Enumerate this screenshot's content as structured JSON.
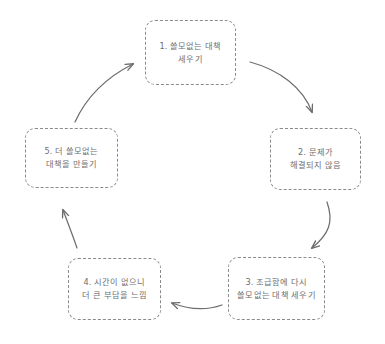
{
  "diagram": {
    "type": "cycle",
    "title": "",
    "background_color": "#ffffff",
    "node_border_color": "#8a8a8a",
    "node_text_color": "#6e6e6e",
    "arrow_color": "#6e6e6e",
    "nodes": [
      {
        "id": "1",
        "number": "1.",
        "label": "1. 쓸모없는 대책\n세우기",
        "line1": "1. 쓸모없는 대책",
        "line2": "세우기"
      },
      {
        "id": "2",
        "number": "2.",
        "label": "2. 문제가\n해결되지 않음",
        "line1": "2. 문제가",
        "line2": "해결되지 않음"
      },
      {
        "id": "3",
        "number": "3.",
        "label": "3. 조급함에 다시\n쓸모없는 대책 세우기",
        "line1": "3. 조급함에 다시",
        "line2": "쓸모없는 대책 세우기"
      },
      {
        "id": "4",
        "number": "4.",
        "label": "4. 시간이 없으니\n더 큰 부담을 느낌",
        "line1": "4. 시간이 없으니",
        "line2": "더 큰 부담을 느낌"
      },
      {
        "id": "5",
        "number": "5.",
        "label": "5. 더 쓸모없는\n대책을 만들기",
        "line1": "5. 더 쓸모없는",
        "line2": "대책을 만들기"
      }
    ],
    "arrows": [
      {
        "id": "arrow-1-2",
        "from": "1",
        "to": "2",
        "style": "curved"
      },
      {
        "id": "arrow-2-3",
        "from": "2",
        "to": "3",
        "style": "curved"
      },
      {
        "id": "arrow-3-4",
        "from": "3",
        "to": "4",
        "style": "curved"
      },
      {
        "id": "arrow-4-5",
        "from": "4",
        "to": "5",
        "style": "straight"
      },
      {
        "id": "arrow-5-1",
        "from": "5",
        "to": "1",
        "style": "curved"
      }
    ]
  }
}
